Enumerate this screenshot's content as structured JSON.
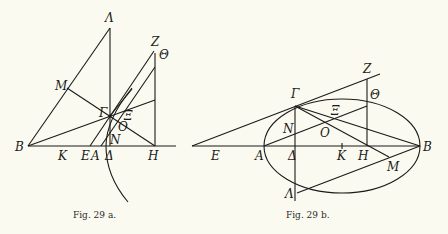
{
  "figures": [
    {
      "id": "fig-29a",
      "caption": "Fig. 29 a.",
      "labels": {
        "Lambda": "Λ",
        "Z": "Z",
        "Theta": "Θ",
        "M": "M",
        "Gamma": "Γ",
        "Xi": "Ξ",
        "O": "O",
        "N": "N",
        "B": "B",
        "K": "K",
        "E": "E",
        "A": "A",
        "Delta": "Δ",
        "H": "H"
      }
    },
    {
      "id": "fig-29b",
      "caption": "Fig. 29 b.",
      "labels": {
        "Z": "Z",
        "Gamma": "Γ",
        "Theta": "Θ",
        "Xi": "Ξ",
        "N": "N",
        "O": "O",
        "E": "E",
        "A": "A",
        "Delta": "Δ",
        "K": "K",
        "H": "H",
        "B": "B",
        "M": "M",
        "Lambda": "Λ"
      }
    }
  ]
}
